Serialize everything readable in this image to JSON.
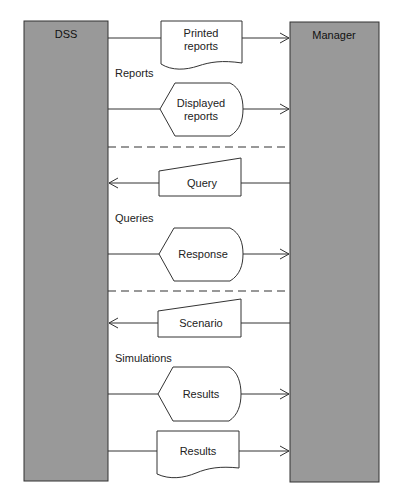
{
  "diagram": {
    "entities": {
      "left": {
        "label": "DSS",
        "color": "#999999"
      },
      "right": {
        "label": "Manager",
        "color": "#999999"
      }
    },
    "sections": [
      {
        "label": "Reports",
        "flows": [
          {
            "shape": "document",
            "line1": "Printed",
            "line2": "reports",
            "direction": "to-manager"
          },
          {
            "shape": "display",
            "line1": "Displayed",
            "line2": "reports",
            "direction": "to-manager"
          }
        ]
      },
      {
        "label": "Queries",
        "flows": [
          {
            "shape": "manual-input",
            "line1": "Query",
            "direction": "to-dss"
          },
          {
            "shape": "display",
            "line1": "Response",
            "direction": "to-manager"
          }
        ]
      },
      {
        "label": "Simulations",
        "flows": [
          {
            "shape": "manual-input",
            "line1": "Scenario",
            "direction": "to-dss"
          },
          {
            "shape": "display",
            "line1": "Results",
            "direction": "to-manager"
          },
          {
            "shape": "document",
            "line1": "Results",
            "direction": "to-manager"
          }
        ]
      }
    ]
  }
}
